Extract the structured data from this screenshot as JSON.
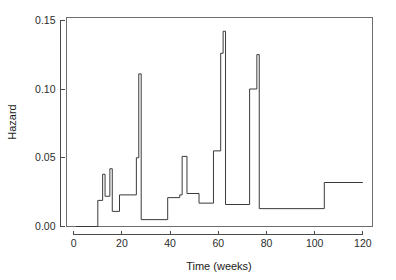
{
  "chart_data": {
    "type": "line",
    "subtype": "step",
    "title": "",
    "xlabel": "Time (weeks)",
    "ylabel": "Hazard",
    "xlim": [
      -3,
      124
    ],
    "ylim": [
      0.0,
      0.152
    ],
    "grid": false,
    "legend": null,
    "x_ticks": [
      0,
      20,
      40,
      60,
      80,
      100,
      120
    ],
    "x_tick_labels": [
      "0",
      "20",
      "40",
      "60",
      "80",
      "100",
      "120"
    ],
    "y_ticks": [
      0.0,
      0.05,
      0.1,
      0.15
    ],
    "y_tick_labels": [
      "0.00",
      "0.05",
      "0.10",
      "0.15"
    ],
    "line_color": "#3a3a3a",
    "frame_color": "#6e6e6e",
    "x": [
      1,
      10,
      11,
      12,
      13,
      14,
      15,
      16,
      17,
      19,
      20,
      23,
      26,
      27,
      28,
      29,
      39,
      40,
      44,
      45,
      46,
      47,
      52,
      53,
      58,
      59,
      60,
      61,
      62,
      63,
      64,
      72,
      73,
      74,
      75,
      76,
      77,
      78,
      104,
      120
    ],
    "y": [
      0.0,
      0.0,
      0.019,
      0.019,
      0.038,
      0.022,
      0.022,
      0.042,
      0.011,
      0.011,
      0.023,
      0.023,
      0.05,
      0.05,
      0.111,
      0.005,
      0.005,
      0.021,
      0.021,
      0.051,
      0.051,
      0.024,
      0.024,
      0.017,
      0.017,
      0.055,
      0.055,
      0.126,
      0.142,
      0.016,
      0.016,
      0.016,
      0.1,
      0.1,
      0.1,
      0.125,
      0.013,
      0.013,
      0.032,
      0.032
    ],
    "series": [
      {
        "name": "Hazard",
        "steps": [
          {
            "x0": 1,
            "x1": 10,
            "value": 0.0
          },
          {
            "x0": 10,
            "x1": 12,
            "value": 0.019
          },
          {
            "x0": 12,
            "x1": 13,
            "value": 0.038
          },
          {
            "x0": 13,
            "x1": 15,
            "value": 0.022
          },
          {
            "x0": 15,
            "x1": 16,
            "value": 0.042
          },
          {
            "x0": 16,
            "x1": 19,
            "value": 0.011
          },
          {
            "x0": 19,
            "x1": 26,
            "value": 0.023
          },
          {
            "x0": 26,
            "x1": 27,
            "value": 0.05
          },
          {
            "x0": 27,
            "x1": 28,
            "value": 0.111
          },
          {
            "x0": 28,
            "x1": 39,
            "value": 0.005
          },
          {
            "x0": 39,
            "x1": 44,
            "value": 0.021
          },
          {
            "x0": 44,
            "x1": 45,
            "value": 0.023
          },
          {
            "x0": 45,
            "x1": 47,
            "value": 0.051
          },
          {
            "x0": 47,
            "x1": 52,
            "value": 0.024
          },
          {
            "x0": 52,
            "x1": 58,
            "value": 0.017
          },
          {
            "x0": 58,
            "x1": 61,
            "value": 0.055
          },
          {
            "x0": 61,
            "x1": 62,
            "value": 0.126
          },
          {
            "x0": 62,
            "x1": 63,
            "value": 0.142
          },
          {
            "x0": 63,
            "x1": 73,
            "value": 0.016
          },
          {
            "x0": 73,
            "x1": 76,
            "value": 0.1
          },
          {
            "x0": 76,
            "x1": 77,
            "value": 0.125
          },
          {
            "x0": 77,
            "x1": 104,
            "value": 0.013
          },
          {
            "x0": 104,
            "x1": 120,
            "value": 0.032
          }
        ]
      }
    ]
  },
  "axes": {
    "x_title": "Time (weeks)",
    "y_title": "Hazard"
  }
}
